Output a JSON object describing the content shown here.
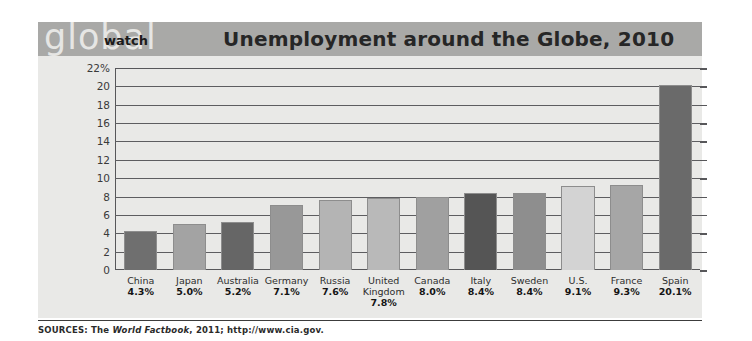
{
  "header": {
    "logo_primary": "global",
    "logo_secondary": "watch",
    "title": "Unemployment around the Globe, 2010",
    "band_color": "#a9a9a7",
    "logo_color": "#e6e6e4",
    "title_color": "#262626"
  },
  "footer": {
    "source_prefix": "SOURCES: The ",
    "source_italic": "World Factbook",
    "source_suffix": ", 2011; http://www.cia.gov."
  },
  "chart_data": {
    "type": "bar",
    "title": "Unemployment around the Globe, 2010",
    "xlabel": "",
    "ylabel": "",
    "ylim": [
      0,
      22
    ],
    "ytick_labels": [
      "22%",
      "20",
      "18",
      "16",
      "14",
      "12",
      "10",
      "8",
      "6",
      "4",
      "2",
      "0"
    ],
    "ytick_values": [
      22,
      20,
      18,
      16,
      14,
      12,
      10,
      8,
      6,
      4,
      2,
      0
    ],
    "grid": true,
    "legend": "none",
    "categories": [
      "China",
      "Japan",
      "Australia",
      "Germany",
      "Russia",
      "United Kingdom",
      "Canada",
      "Italy",
      "Sweden",
      "U.S.",
      "France",
      "Spain"
    ],
    "values": [
      4.3,
      5.0,
      5.2,
      7.1,
      7.6,
      7.8,
      8.0,
      8.4,
      8.4,
      9.1,
      9.3,
      20.1
    ],
    "value_labels": [
      "4.3%",
      "5.0%",
      "5.2%",
      "7.1%",
      "7.6%",
      "7.8%",
      "8.0%",
      "8.4%",
      "8.4%",
      "9.1%",
      "9.3%",
      "20.1%"
    ],
    "bar_colors": [
      "#6f6f6f",
      "#a3a3a3",
      "#666666",
      "#989898",
      "#b4b4b4",
      "#b9b9b9",
      "#a0a0a0",
      "#555555",
      "#8e8e8e",
      "#d3d3d3",
      "#a6a6a6",
      "#6a6a6a"
    ],
    "plot_background": "#e9e9e7",
    "axis_color": "#57575a"
  }
}
